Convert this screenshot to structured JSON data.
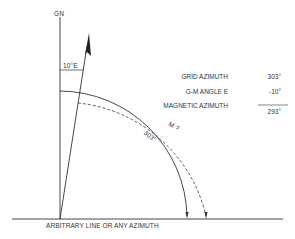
{
  "diagram": {
    "north_labels": {
      "grid_north": "GN",
      "declination": "10°E"
    },
    "arc_labels": {
      "grid_arc": "303°",
      "magnetic_arc": "M ?"
    },
    "calculation": {
      "rows": [
        {
          "label": "GRID AZIMUTH",
          "value": "303°"
        },
        {
          "label": "G-M ANGLE E",
          "value": "-10°"
        },
        {
          "label": "MAGNETIC AZIMUTH",
          "value": "293°"
        }
      ]
    },
    "baseline_label": "ARBITRARY LINE OR ANY AZIMUTH",
    "colors": {
      "line": "#333333",
      "background": "#ffffff"
    }
  }
}
